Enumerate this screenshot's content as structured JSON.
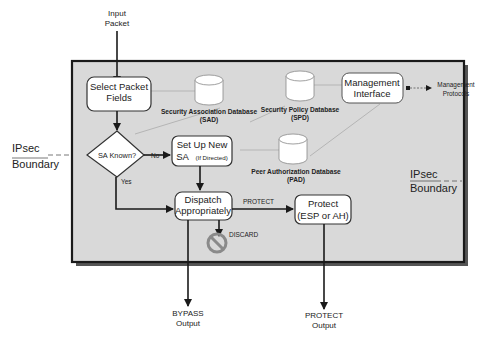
{
  "diagram": {
    "colors": {
      "boundary_fill": "#d9d9d9",
      "boundary_stroke": "#1a1a1a",
      "node_fill": "#ffffff",
      "node_stroke": "#333333",
      "connector": "#b5b5b5",
      "discard_icon": "#8a8a8a"
    },
    "external": {
      "input_line1": "Input",
      "input_line2": "Packet",
      "mgmt_protocols_line1": "Management",
      "mgmt_protocols_line2": "Protocols",
      "bypass_line1": "BYPASS",
      "bypass_line2": "Output",
      "protect_out_line1": "PROTECT",
      "protect_out_line2": "Output"
    },
    "boundary": {
      "left_line1": "IPsec",
      "left_line2": "Boundary",
      "right_line1": "IPsec",
      "right_line2": "Boundary"
    },
    "nodes": {
      "select_line1": "Select Packet",
      "select_line2": "Fields",
      "sa_known": "SA Known?",
      "setup_line1": "Set Up New",
      "setup_line2_main": "SA",
      "setup_line2_small": "(If Directed)",
      "dispatch_line1": "Dispatch",
      "dispatch_line2": "Appropriately",
      "protect_line1": "Protect",
      "protect_line2": "(ESP or AH)",
      "mgmt_line1": "Management",
      "mgmt_line2": "Interface"
    },
    "databases": {
      "sad_line1": "Security Association Database",
      "sad_line2": "(SAD)",
      "spd_line1": "Security Policy Database",
      "spd_line2": "(SPD)",
      "pad_line1": "Peer Authorization Database",
      "pad_line2": "(PAD)"
    },
    "edges": {
      "no": "No",
      "yes": "Yes",
      "protect": "PROTECT",
      "discard": "DISCARD"
    }
  }
}
